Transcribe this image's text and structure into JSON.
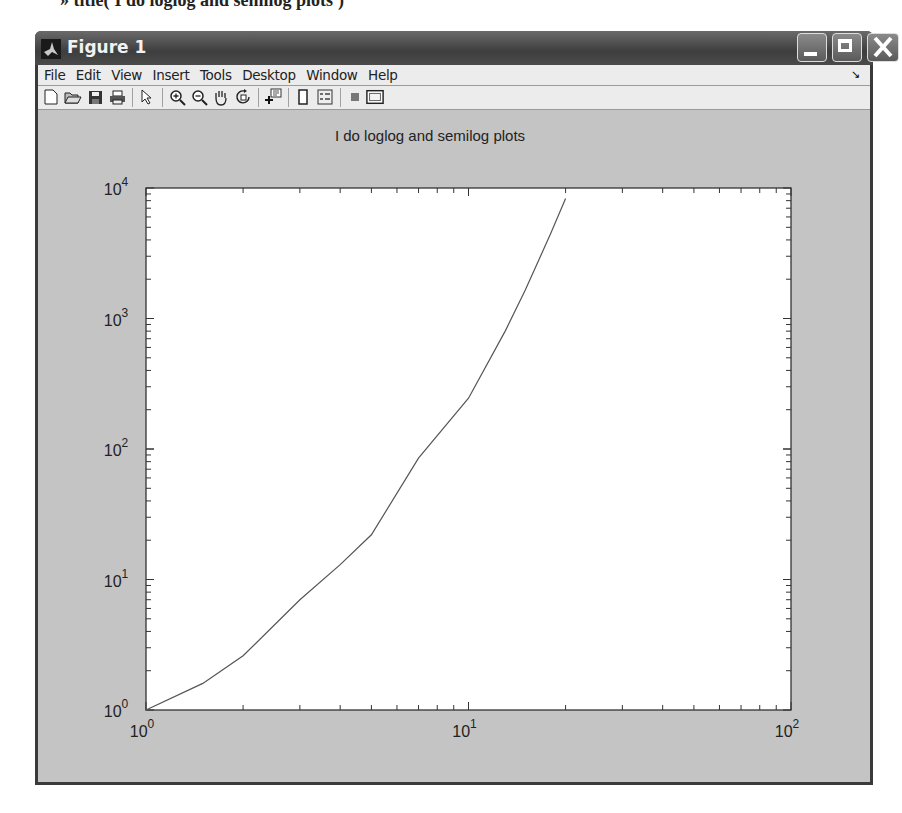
{
  "command_line": "» title('I do loglog and semilog plots')",
  "window": {
    "title": "Figure 1",
    "controls": {
      "minimize": "minimize",
      "maximize": "maximize",
      "close": "close"
    }
  },
  "menubar": {
    "items": [
      "File",
      "Edit",
      "View",
      "Insert",
      "Tools",
      "Desktop",
      "Window",
      "Help"
    ],
    "corner_icon": "dock-arrow-icon"
  },
  "toolbar": {
    "buttons": [
      {
        "name": "new-figure",
        "icon": "new-file-icon"
      },
      {
        "name": "open-file",
        "icon": "open-folder-icon"
      },
      {
        "name": "save-figure",
        "icon": "save-disk-icon"
      },
      {
        "name": "print-figure",
        "icon": "printer-icon"
      },
      {
        "name": "edit-plot",
        "icon": "pointer-arrow-icon"
      },
      {
        "name": "zoom-in",
        "icon": "zoom-in-icon"
      },
      {
        "name": "zoom-out",
        "icon": "zoom-out-icon"
      },
      {
        "name": "pan",
        "icon": "hand-icon"
      },
      {
        "name": "rotate-3d",
        "icon": "rotate-icon"
      },
      {
        "name": "data-cursor",
        "icon": "data-cursor-icon"
      },
      {
        "name": "insert-colorbar",
        "icon": "colorbar-icon"
      },
      {
        "name": "insert-legend",
        "icon": "legend-icon"
      },
      {
        "name": "hide-plot-tools",
        "icon": "hide-tools-icon"
      },
      {
        "name": "show-plot-tools",
        "icon": "show-tools-icon"
      }
    ]
  },
  "colors": {
    "titlebar": "#4a4a4a",
    "figure_bg": "#c4c4c4",
    "axes_bg": "#ffffff",
    "line": "#555555",
    "menubar": "#ececec"
  },
  "chart_data": {
    "type": "line",
    "title": "I do loglog and semilog plots",
    "xlabel": "",
    "ylabel": "",
    "xscale": "log",
    "yscale": "log",
    "xlim": [
      1,
      100
    ],
    "ylim": [
      1,
      10000
    ],
    "x_tick_labels": [
      {
        "base": "10",
        "exp": "0"
      },
      {
        "base": "10",
        "exp": "1"
      },
      {
        "base": "10",
        "exp": "2"
      }
    ],
    "y_tick_labels": [
      {
        "base": "10",
        "exp": "0"
      },
      {
        "base": "10",
        "exp": "1"
      },
      {
        "base": "10",
        "exp": "2"
      },
      {
        "base": "10",
        "exp": "3"
      },
      {
        "base": "10",
        "exp": "4"
      }
    ],
    "grid": false,
    "legend": null,
    "series": [
      {
        "name": "curve",
        "x": [
          1,
          1.5,
          2,
          3,
          4,
          5,
          7,
          10,
          13,
          15,
          18,
          20
        ],
        "y": [
          1,
          1.6,
          2.6,
          7,
          13,
          22,
          85,
          245,
          800,
          1650,
          4500,
          8300
        ]
      }
    ]
  }
}
